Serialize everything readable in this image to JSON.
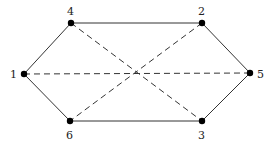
{
  "diagram": {
    "type": "graph",
    "nodes": [
      {
        "id": "1",
        "label": "1",
        "x": 24,
        "y": 74,
        "lx": 10,
        "ly": 78
      },
      {
        "id": "4",
        "label": "4",
        "x": 71,
        "y": 23,
        "lx": 67,
        "ly": 15
      },
      {
        "id": "2",
        "label": "2",
        "x": 202,
        "y": 23,
        "lx": 198,
        "ly": 15
      },
      {
        "id": "5",
        "label": "5",
        "x": 250,
        "y": 73,
        "lx": 257,
        "ly": 78
      },
      {
        "id": "3",
        "label": "3",
        "x": 202,
        "y": 121,
        "lx": 198,
        "ly": 139
      },
      {
        "id": "6",
        "label": "6",
        "x": 70,
        "y": 121,
        "lx": 66,
        "ly": 139
      }
    ],
    "edges": [
      {
        "from": "1",
        "to": "4",
        "style": "solid"
      },
      {
        "from": "4",
        "to": "2",
        "style": "solid"
      },
      {
        "from": "2",
        "to": "5",
        "style": "solid"
      },
      {
        "from": "5",
        "to": "3",
        "style": "solid"
      },
      {
        "from": "3",
        "to": "6",
        "style": "solid"
      },
      {
        "from": "6",
        "to": "1",
        "style": "solid"
      },
      {
        "from": "1",
        "to": "5",
        "style": "dashed"
      },
      {
        "from": "4",
        "to": "3",
        "style": "dashed"
      },
      {
        "from": "2",
        "to": "6",
        "style": "dashed"
      }
    ],
    "colors": {
      "line": "#333333",
      "node": "#000000",
      "background": "#ffffff"
    }
  }
}
